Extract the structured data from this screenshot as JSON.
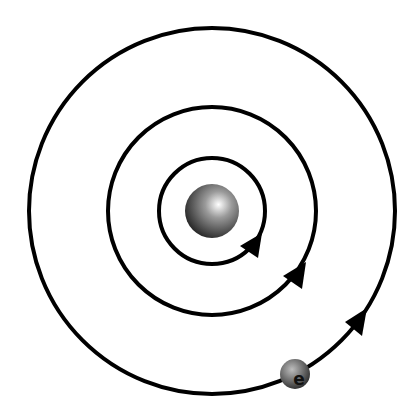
{
  "diagram": {
    "type": "bohr-atom-model",
    "nucleus": {
      "cx": 212,
      "cy": 211,
      "r": 27
    },
    "orbits": [
      {
        "name": "inner-orbit",
        "r": 53,
        "arrow_angle_deg": 42
      },
      {
        "name": "middle-orbit",
        "r": 104,
        "arrow_angle_deg": 40
      },
      {
        "name": "outer-orbit",
        "r": 183,
        "arrow_angle_deg": 44
      }
    ],
    "electron": {
      "label": "e",
      "cx": 295,
      "cy": 374,
      "r": 15
    },
    "colors": {
      "stroke": "#000000",
      "background": "#ffffff"
    }
  }
}
